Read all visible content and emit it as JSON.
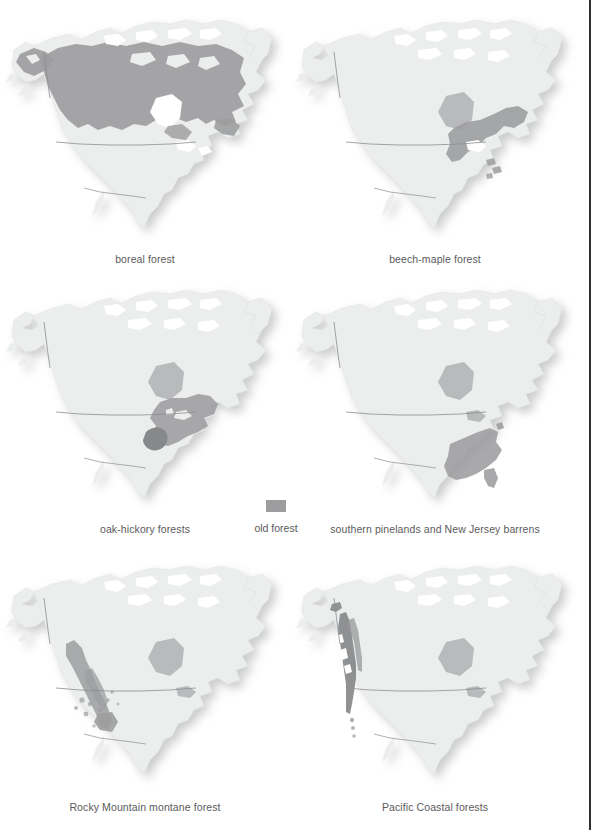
{
  "page": {
    "background": "#ffffff",
    "rule_color": "#2f2f2f",
    "rule_x": 589
  },
  "palette": {
    "land": "#eceded",
    "land_edge": "#dcdddd",
    "border_line": "#8d8e90",
    "highlight": "#9d9d9f",
    "highlight_dark": "#87888a",
    "water_inset": "#b9babc",
    "shadow": "#d9dadb",
    "caption_text": "#5a5a5c"
  },
  "legend": {
    "swatch_color": "#9d9d9f",
    "label": "old forest",
    "swatch_name": "old-forest-swatch"
  },
  "maps": [
    {
      "id": "boreal-forest",
      "caption": "boreal forest",
      "region_label": "boreal forest range",
      "row": 1,
      "column": 1
    },
    {
      "id": "beech-maple-forest",
      "caption": "beech-maple forest",
      "region_label": "beech-maple forest range",
      "row": 1,
      "column": 2
    },
    {
      "id": "oak-hickory-forests",
      "caption": "oak-hickory forests",
      "region_label": "oak-hickory forests range",
      "row": 2,
      "column": 1
    },
    {
      "id": "southern-pinelands-new-jersey-barrens",
      "caption": "southern pinelands and New Jersey barrens",
      "region_label": "southern pinelands range",
      "row": 2,
      "column": 2
    },
    {
      "id": "rocky-mountain-montane-forest",
      "caption": "Rocky Mountain montane forest",
      "region_label": "Rocky Mountain montane forest range",
      "row": 3,
      "column": 1
    },
    {
      "id": "pacific-coastal-forests",
      "caption": "Pacific Coastal forests",
      "region_label": "Pacific Coastal forests range",
      "row": 3,
      "column": 2
    }
  ]
}
